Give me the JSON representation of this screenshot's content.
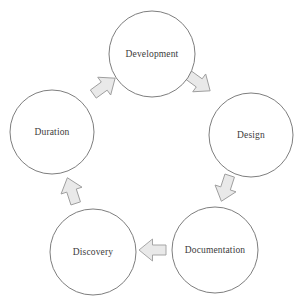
{
  "diagram": {
    "type": "cycle",
    "direction": "clockwise",
    "stage_count": 5,
    "colors": {
      "circle_stroke": "#6f6f6f",
      "circle_fill": "#ffffff",
      "label_text": "#3b3b3b",
      "arrow_fill": "#e9e9e9",
      "arrow_stroke": "#9d9d9d",
      "background": "#ffffff"
    },
    "stages": [
      {
        "id": "development",
        "label": "Development",
        "order": 1,
        "position": "top",
        "cx": 152,
        "cy": 54,
        "r": 43
      },
      {
        "id": "design",
        "label": "Design",
        "order": 2,
        "position": "right",
        "cx": 251,
        "cy": 135,
        "r": 42
      },
      {
        "id": "documentation",
        "label": "Documentation",
        "order": 3,
        "position": "bottom-right",
        "cx": 215,
        "cy": 250,
        "r": 43
      },
      {
        "id": "discovery",
        "label": "Discovery",
        "order": 4,
        "position": "bottom-left",
        "cx": 93,
        "cy": 252,
        "r": 43
      },
      {
        "id": "duration",
        "label": "Duration",
        "order": 5,
        "position": "left",
        "cx": 52,
        "cy": 132,
        "r": 42
      }
    ],
    "arrows": [
      {
        "id": "arrow-development-design",
        "from": "development",
        "to": "design",
        "direction": "down-right",
        "rotation_deg": 126,
        "cx": 198,
        "cy": 82
      },
      {
        "id": "arrow-design-documentation",
        "from": "design",
        "to": "documentation",
        "direction": "down-left",
        "rotation_deg": 198,
        "cx": 226,
        "cy": 187
      },
      {
        "id": "arrow-documentation-discovery",
        "from": "documentation",
        "to": "discovery",
        "direction": "left",
        "rotation_deg": 270,
        "cx": 154,
        "cy": 250
      },
      {
        "id": "arrow-discovery-duration",
        "from": "discovery",
        "to": "duration",
        "direction": "up",
        "rotation_deg": 342,
        "cx": 72,
        "cy": 192
      },
      {
        "id": "arrow-duration-development",
        "from": "duration",
        "to": "development",
        "direction": "up-right",
        "rotation_deg": 54,
        "cx": 103,
        "cy": 87
      }
    ]
  }
}
